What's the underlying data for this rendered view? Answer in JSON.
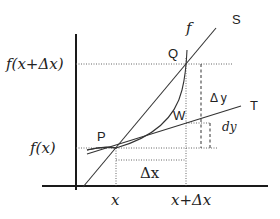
{
  "diagram": {
    "type": "derivative-differential-illustration",
    "labels": {
      "y_high": "f(x+Δx)",
      "y_low": "f(x)",
      "x_low": "x",
      "x_high": "x+Δx",
      "curve": "f",
      "secant": "S",
      "tangent": "T",
      "point_p": "P",
      "point_q": "Q",
      "point_w": "W",
      "delta_x": "Δx",
      "delta_y": "Δ y",
      "dy": "dy"
    },
    "colors": {
      "axis": "#1a1a1a",
      "line": "#333333",
      "guide": "#666666",
      "text": "#222222"
    }
  }
}
